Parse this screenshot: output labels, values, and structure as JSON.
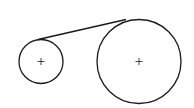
{
  "diagram": {
    "stroke_color": "#1a1a1a",
    "background_color": "#ffffff",
    "elements": [
      {
        "id": "small-pulley",
        "label": "small circle",
        "center_marker": "plus"
      },
      {
        "id": "large-pulley",
        "label": "large circle",
        "center_marker": "plus"
      },
      {
        "id": "belt",
        "label": "upper tangent line"
      }
    ]
  }
}
